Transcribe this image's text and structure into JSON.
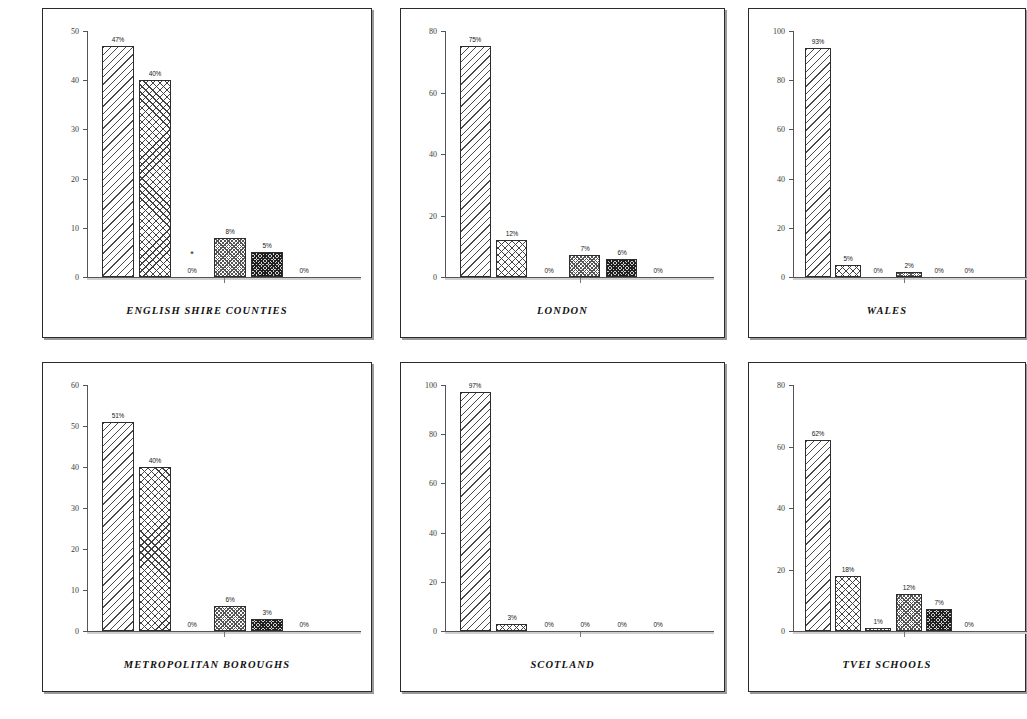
{
  "document": {
    "kind": "scanned-page-of-bar-charts",
    "panel_count": 6
  },
  "style": {
    "ink": "#2b2b2b",
    "axis": "#555555",
    "label": "#1a1a1a"
  },
  "chart_data": [
    {
      "type": "bar",
      "title": "ENGLISH SHIRE COUNTIES",
      "xlabel": "",
      "ylabel": "",
      "ylim": [
        0,
        50
      ],
      "yticks": [
        0,
        10,
        20,
        30,
        40,
        50
      ],
      "ytick_labels": [
        "0",
        "10",
        "20",
        "30",
        "40",
        "50"
      ],
      "grid": false,
      "legend": "none",
      "categories": [
        "1",
        "2",
        "3",
        "4",
        "5",
        "6"
      ],
      "values": [
        47,
        40,
        0,
        8,
        5,
        0
      ],
      "data_labels": [
        "47%",
        "40%",
        "0%",
        "8%",
        "5%",
        "0%"
      ],
      "patterns": [
        "diagonal",
        "crosshatch",
        "none",
        "checker",
        "dense",
        "none"
      ],
      "annotations": [
        {
          "text": "*",
          "category": "3"
        }
      ]
    },
    {
      "type": "bar",
      "title": "LONDON",
      "xlabel": "",
      "ylabel": "",
      "ylim": [
        0,
        80
      ],
      "yticks": [
        0,
        20,
        40,
        60,
        80
      ],
      "ytick_labels": [
        "0",
        "20",
        "40",
        "60",
        "80"
      ],
      "grid": false,
      "legend": "none",
      "categories": [
        "1",
        "2",
        "3",
        "4",
        "5",
        "6"
      ],
      "values": [
        75,
        12,
        0,
        7,
        6,
        0
      ],
      "data_labels": [
        "75%",
        "12%",
        "0%",
        "7%",
        "6%",
        "0%"
      ],
      "patterns": [
        "diagonal",
        "crosshatch",
        "none",
        "checker",
        "dense",
        "none"
      ],
      "annotations": []
    },
    {
      "type": "bar",
      "title": "WALES",
      "xlabel": "",
      "ylabel": "",
      "ylim": [
        0,
        100
      ],
      "yticks": [
        0,
        20,
        40,
        60,
        80,
        100
      ],
      "ytick_labels": [
        "0",
        "20",
        "40",
        "60",
        "80",
        "100"
      ],
      "grid": false,
      "legend": "none",
      "categories": [
        "1",
        "2",
        "3",
        "4",
        "5",
        "6"
      ],
      "values": [
        93,
        5,
        0,
        2,
        0,
        0
      ],
      "data_labels": [
        "93%",
        "5%",
        "0%",
        "2%",
        "0%",
        "0%"
      ],
      "patterns": [
        "diagonal",
        "crosshatch",
        "none",
        "checker",
        "none",
        "none"
      ],
      "annotations": []
    },
    {
      "type": "bar",
      "title": "METROPOLITAN BOROUGHS",
      "xlabel": "",
      "ylabel": "",
      "ylim": [
        0,
        60
      ],
      "yticks": [
        0,
        10,
        20,
        30,
        40,
        50,
        60
      ],
      "ytick_labels": [
        "0",
        "10",
        "20",
        "30",
        "40",
        "50",
        "60"
      ],
      "grid": false,
      "legend": "none",
      "categories": [
        "1",
        "2",
        "3",
        "4",
        "5",
        "6"
      ],
      "values": [
        51,
        40,
        0,
        6,
        3,
        0
      ],
      "data_labels": [
        "51%",
        "40%",
        "0%",
        "6%",
        "3%",
        "0%"
      ],
      "patterns": [
        "diagonal",
        "crosshatch",
        "none",
        "checker",
        "dense",
        "none"
      ],
      "annotations": []
    },
    {
      "type": "bar",
      "title": "SCOTLAND",
      "xlabel": "",
      "ylabel": "",
      "ylim": [
        0,
        100
      ],
      "yticks": [
        0,
        20,
        40,
        60,
        80,
        100
      ],
      "ytick_labels": [
        "0",
        "20",
        "40",
        "60",
        "80",
        "100"
      ],
      "grid": false,
      "legend": "none",
      "categories": [
        "1",
        "2",
        "3",
        "4",
        "5",
        "6"
      ],
      "values": [
        97,
        3,
        0,
        0,
        0,
        0
      ],
      "data_labels": [
        "97%",
        "3%",
        "0%",
        "0%",
        "0%",
        "0%"
      ],
      "patterns": [
        "diagonal",
        "crosshatch",
        "none",
        "none",
        "none",
        "none"
      ],
      "annotations": []
    },
    {
      "type": "bar",
      "title": "TVEI SCHOOLS",
      "xlabel": "",
      "ylabel": "",
      "ylim": [
        0,
        80
      ],
      "yticks": [
        0,
        20,
        40,
        60,
        80
      ],
      "ytick_labels": [
        "0",
        "20",
        "40",
        "60",
        "80"
      ],
      "grid": false,
      "legend": "none",
      "categories": [
        "1",
        "2",
        "3",
        "4",
        "5",
        "6"
      ],
      "values": [
        62,
        18,
        1,
        12,
        7,
        0
      ],
      "data_labels": [
        "62%",
        "18%",
        "1%",
        "12%",
        "7%",
        "0%"
      ],
      "patterns": [
        "diagonal",
        "crosshatch",
        "checker",
        "checker",
        "dense",
        "none"
      ],
      "annotations": []
    }
  ],
  "layout": {
    "panels": [
      {
        "x": 42,
        "y": 8,
        "w": 330,
        "h": 330,
        "clipped_right": false
      },
      {
        "x": 400,
        "y": 8,
        "w": 325,
        "h": 330,
        "clipped_right": false
      },
      {
        "x": 748,
        "y": 8,
        "w": 278,
        "h": 330,
        "clipped_right": true
      },
      {
        "x": 42,
        "y": 362,
        "w": 330,
        "h": 330,
        "clipped_right": false
      },
      {
        "x": 400,
        "y": 362,
        "w": 325,
        "h": 330,
        "clipped_right": false
      },
      {
        "x": 748,
        "y": 362,
        "w": 278,
        "h": 330,
        "clipped_right": true
      }
    ],
    "plot_box": {
      "left_pad": 44,
      "right_pad": 12,
      "top_pad": 22,
      "bottom_pad": 62
    },
    "bar_slot_count": 6
  }
}
